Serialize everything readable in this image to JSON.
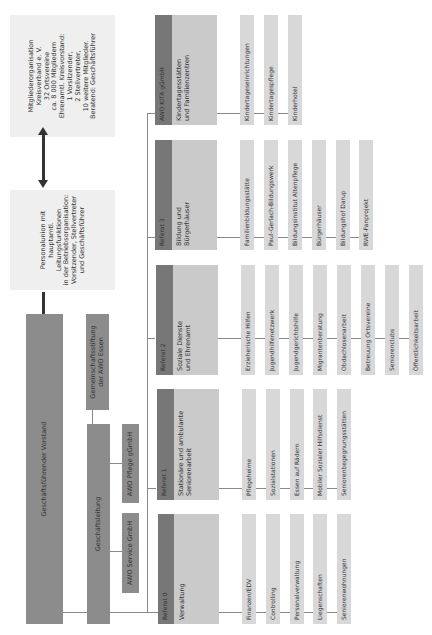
{
  "info_boxes": {
    "mitglieder": {
      "lines": [
        "Mitgliederorganisation",
        "Kreisverband e. V.",
        "32 Ortsvereine",
        "ca. 8 000 Mitgliedern",
        "Ehrenamtl. Kreisvorstand:",
        "1 Vorsitzender,",
        "2 Stellvertreter,",
        "10 weitere Mitglieder.",
        "Beratend: Geschäftsführer"
      ]
    },
    "personalunion": {
      "lines": [
        "Personalunion mit",
        "hauptamtl.",
        "Leitungsfunktionen",
        "in der Betriebsorganisation:",
        "Vorsitzender, Stellvertreter",
        "und Geschäftsführer"
      ]
    }
  },
  "leadership": {
    "vorstand": "Geschäftsführender Vorstand",
    "stiftung_line1": "Gemeinschaftsstiftung",
    "stiftung_line2": "der AWO Essen",
    "geschaeftsleitung": "Geschäftsleitung",
    "pflege": "AWO Pflege gGmbH",
    "service": "AWO Service GmbH"
  },
  "divisions": [
    {
      "tag": "AWO KITA gGmbH",
      "title_line1": "Kindertagesstätten",
      "title_line2": "und Familienzentren",
      "items": [
        "Kindertageseinrichtungen",
        "Kindertagespflege",
        "Kinderhotel"
      ]
    },
    {
      "tag": "Referat 3",
      "title_line1": "Bildung und",
      "title_line2": "Bürgerhäuser",
      "items": [
        "Familienbildungsstätte",
        "Paul-Gerlach-Bildungswerk",
        "Bildungsinstitut Altenpflege",
        "Bürgerhäuser",
        "Bildungshof Darup",
        "RWE-Fanprojekt"
      ]
    },
    {
      "tag": "Referat 2",
      "title_line1": "Soziale Dienste",
      "title_line2": "und Ehrenamt",
      "items": [
        "Erzieherische Hilfen",
        "Jugendhilfenetzwerk",
        "Jugendgerichtshilfe",
        "Migrantenberatung",
        "Obdachlosenarbeit",
        "Betreuung Ortsvereine",
        "Seniorenclubs",
        "Öffentlichkeitsarbeit"
      ]
    },
    {
      "tag": "Referat 1",
      "title_line1": "Stationäre und ambulante",
      "title_line2": "Seniorenarbeit",
      "items": [
        "Pflegeheime",
        "Sozialstationen",
        "Essen auf Rädern",
        "Mobiler Sozialer Hilfsdienst",
        "Seniorenbegegnungsstätten"
      ]
    },
    {
      "tag": "Referat 0",
      "title_line1": "Verwaltung",
      "title_line2": "",
      "items": [
        "Finanzen/EDV",
        "Controlling",
        "Personalverwaltung",
        "Liegenschaften",
        "Seniorenwohnungen"
      ]
    }
  ],
  "colors": {
    "info_bg": "#efefef",
    "dark_box": "#8c8c8c",
    "tag_strip": "#777777",
    "division_bg": "#cacaca",
    "item_bg": "#d8d8d8",
    "connector": "#8a8a8a",
    "arrow": "#333333"
  }
}
